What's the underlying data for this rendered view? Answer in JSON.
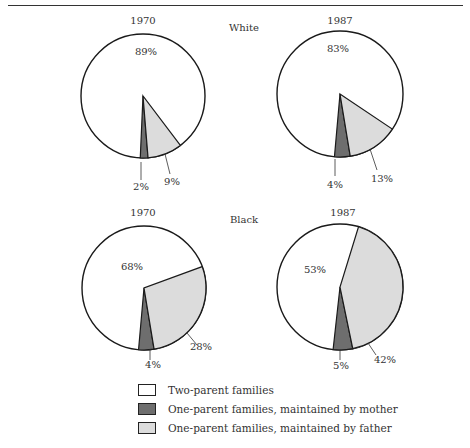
{
  "chart_data": [
    {
      "type": "pie",
      "group": "White",
      "title": "1970",
      "categories": [
        "Two-parent families",
        "One-parent families, maintained by mother",
        "One-parent families, maintained by father"
      ],
      "values": [
        89,
        2,
        9
      ],
      "labels": [
        "89%",
        "2%",
        "9%"
      ]
    },
    {
      "type": "pie",
      "group": "White",
      "title": "1987",
      "categories": [
        "Two-parent families",
        "One-parent families, maintained by mother",
        "One-parent families, maintained by father"
      ],
      "values": [
        83,
        4,
        13
      ],
      "labels": [
        "83%",
        "4%",
        "13%"
      ]
    },
    {
      "type": "pie",
      "group": "Black",
      "title": "1970",
      "categories": [
        "Two-parent families",
        "One-parent families, maintained by mother",
        "One-parent families, maintained by father"
      ],
      "values": [
        68,
        4,
        28
      ],
      "labels": [
        "68%",
        "4%",
        "28%"
      ]
    },
    {
      "type": "pie",
      "group": "Black",
      "title": "1987",
      "categories": [
        "Two-parent families",
        "One-parent families, maintained by mother",
        "One-parent families, maintained by father"
      ],
      "values": [
        53,
        5,
        42
      ],
      "labels": [
        "53%",
        "5%",
        "42%"
      ]
    }
  ],
  "groups": [
    {
      "label": "White"
    },
    {
      "label": "Black"
    }
  ],
  "colors": {
    "two_parent": "#ffffff",
    "mother": "#6e6e6e",
    "father": "#dcdcdc",
    "outline": "#1a1a1a"
  },
  "legend": {
    "items": [
      {
        "label": "Two-parent families",
        "color": "#ffffff"
      },
      {
        "label": "One-parent families, maintained by mother",
        "color": "#6e6e6e"
      },
      {
        "label": "One-parent families, maintained by father",
        "color": "#dcdcdc"
      }
    ]
  }
}
